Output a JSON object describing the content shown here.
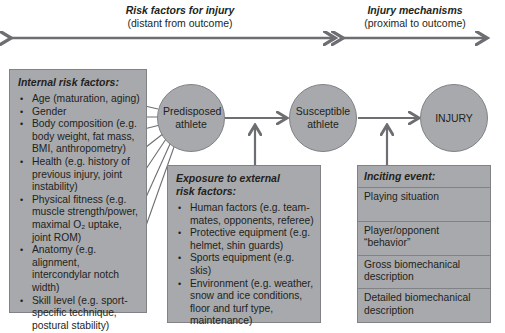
{
  "header": {
    "left_title": "Risk factors for injury",
    "left_subtitle": "(distant from outcome)",
    "right_title": "Injury mechanisms",
    "right_subtitle": "(proximal to outcome)"
  },
  "nodes": {
    "predisposed": "Predisposed athlete",
    "susceptible": "Susceptible athlete",
    "injury": "INJURY"
  },
  "internal": {
    "title": "Internal risk factors:",
    "items": [
      "Age (maturation, aging)",
      "Gender",
      "Body composition (e.g. body weight, fat mass, BMI, anthropometry)",
      "Health (e.g. history of previous injury, joint instability)",
      "Physical fitness (e.g. muscle strength/power, maximal O₂ uptake, joint ROM)",
      "Anatomy (e.g. alignment, intercondylar notch width)",
      "Skill level (e.g. sport-specific technique, postural stability)"
    ]
  },
  "external": {
    "title": "Exposure to external risk factors:",
    "items": [
      "Human factors (e.g. team-mates, opponents, referee)",
      "Protective equipment (e.g. helmet, shin guards)",
      "Sports equipment (e.g. skis)",
      "Environment (e.g. weather, snow and ice conditions, floor and turf type, maintenance)"
    ]
  },
  "inciting": {
    "title": "Inciting event:",
    "items": [
      "Playing situation",
      "Player/opponent “behavior”",
      "Gross biomechanical description",
      "Detailed biomechanical description"
    ]
  },
  "colors": {
    "fill": "#a7a9ac",
    "stroke": "#808285",
    "arrow": "#6d6e71"
  }
}
